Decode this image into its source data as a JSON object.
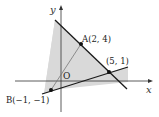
{
  "diagram": {
    "type": "coordinate-plane",
    "axes": {
      "x_label": "x",
      "y_label": "y",
      "origin_label": "O"
    },
    "points": [
      {
        "name": "A",
        "label": "A(2, 4)",
        "x": 2,
        "y": 4
      },
      {
        "name": "P",
        "label": "(5, 1)",
        "x": 5,
        "y": 1
      },
      {
        "name": "B",
        "label": "B(−1, −1)",
        "x": -1,
        "y": -1
      }
    ],
    "lines": [
      {
        "name": "line-through-A-and-(5,1)",
        "through": [
          "A",
          "P"
        ]
      },
      {
        "name": "line-through-B-and-(5,1)",
        "through": [
          "B",
          "P"
        ]
      },
      {
        "name": "segment-B-to-A",
        "through": [
          "B",
          "A"
        ]
      }
    ],
    "shaded_region": {
      "description": "gray shaded region bounded by the two lines",
      "color": "#d9d9d9"
    },
    "colors": {
      "line": "#1a1a1a",
      "thin_line": "#666666",
      "axis": "#333333",
      "shade": "#d9d9d9"
    }
  }
}
